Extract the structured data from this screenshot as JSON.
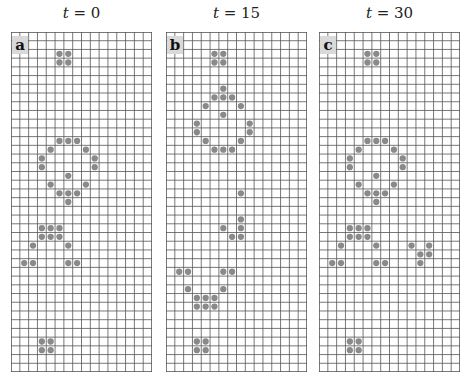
{
  "figure": {
    "grid_cols": 16,
    "grid_rows": 39,
    "line_color": "#555555",
    "cell_color": "#8a8a8a",
    "panels": [
      {
        "label": "a",
        "title_var": "t",
        "title_eq": " = 0",
        "live_cells": [
          [
            2,
            5
          ],
          [
            2,
            6
          ],
          [
            3,
            5
          ],
          [
            3,
            6
          ],
          [
            12,
            5
          ],
          [
            12,
            6
          ],
          [
            12,
            7
          ],
          [
            13,
            4
          ],
          [
            13,
            8
          ],
          [
            14,
            3
          ],
          [
            14,
            9
          ],
          [
            15,
            3
          ],
          [
            15,
            9
          ],
          [
            16,
            6
          ],
          [
            17,
            4
          ],
          [
            17,
            8
          ],
          [
            18,
            5
          ],
          [
            18,
            6
          ],
          [
            18,
            7
          ],
          [
            19,
            6
          ],
          [
            22,
            3
          ],
          [
            22,
            4
          ],
          [
            22,
            5
          ],
          [
            23,
            3
          ],
          [
            23,
            4
          ],
          [
            23,
            5
          ],
          [
            24,
            2
          ],
          [
            24,
            6
          ],
          [
            26,
            1
          ],
          [
            26,
            2
          ],
          [
            26,
            6
          ],
          [
            26,
            7
          ],
          [
            35,
            3
          ],
          [
            35,
            4
          ],
          [
            36,
            3
          ],
          [
            36,
            4
          ]
        ]
      },
      {
        "label": "b",
        "title_var": "t",
        "title_eq": " = 15",
        "live_cells": [
          [
            2,
            5
          ],
          [
            2,
            6
          ],
          [
            3,
            5
          ],
          [
            3,
            6
          ],
          [
            6,
            6
          ],
          [
            7,
            5
          ],
          [
            7,
            6
          ],
          [
            7,
            7
          ],
          [
            8,
            4
          ],
          [
            8,
            8
          ],
          [
            9,
            6
          ],
          [
            10,
            3
          ],
          [
            10,
            9
          ],
          [
            11,
            3
          ],
          [
            11,
            9
          ],
          [
            12,
            4
          ],
          [
            12,
            8
          ],
          [
            13,
            5
          ],
          [
            13,
            6
          ],
          [
            13,
            7
          ],
          [
            18,
            8
          ],
          [
            21,
            8
          ],
          [
            22,
            6
          ],
          [
            22,
            8
          ],
          [
            23,
            7
          ],
          [
            23,
            8
          ],
          [
            27,
            1
          ],
          [
            27,
            2
          ],
          [
            27,
            6
          ],
          [
            27,
            7
          ],
          [
            29,
            2
          ],
          [
            29,
            6
          ],
          [
            30,
            3
          ],
          [
            30,
            4
          ],
          [
            30,
            5
          ],
          [
            31,
            3
          ],
          [
            31,
            4
          ],
          [
            31,
            5
          ],
          [
            35,
            3
          ],
          [
            35,
            4
          ],
          [
            36,
            3
          ],
          [
            36,
            4
          ]
        ]
      },
      {
        "label": "c",
        "title_var": "t",
        "title_eq": " = 30",
        "live_cells": [
          [
            2,
            5
          ],
          [
            2,
            6
          ],
          [
            3,
            5
          ],
          [
            3,
            6
          ],
          [
            12,
            5
          ],
          [
            12,
            6
          ],
          [
            12,
            7
          ],
          [
            13,
            4
          ],
          [
            13,
            8
          ],
          [
            14,
            3
          ],
          [
            14,
            9
          ],
          [
            15,
            3
          ],
          [
            15,
            9
          ],
          [
            16,
            6
          ],
          [
            17,
            4
          ],
          [
            17,
            8
          ],
          [
            18,
            5
          ],
          [
            18,
            6
          ],
          [
            18,
            7
          ],
          [
            19,
            6
          ],
          [
            22,
            3
          ],
          [
            22,
            4
          ],
          [
            22,
            5
          ],
          [
            23,
            3
          ],
          [
            23,
            4
          ],
          [
            23,
            5
          ],
          [
            24,
            2
          ],
          [
            24,
            6
          ],
          [
            26,
            1
          ],
          [
            26,
            2
          ],
          [
            26,
            6
          ],
          [
            26,
            7
          ],
          [
            24,
            10
          ],
          [
            24,
            12
          ],
          [
            25,
            11
          ],
          [
            25,
            12
          ],
          [
            26,
            11
          ],
          [
            35,
            3
          ],
          [
            35,
            4
          ],
          [
            36,
            3
          ],
          [
            36,
            4
          ]
        ]
      }
    ]
  }
}
